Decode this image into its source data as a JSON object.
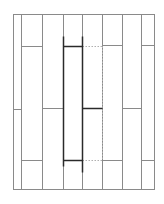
{
  "diagram": {
    "title": "",
    "colors": {
      "line": "#8a8a8a",
      "highlight": "#2a2a2a",
      "dotted": "#b0b0b0",
      "background": "#ffffff"
    },
    "outer": {
      "x1": 13,
      "y1": 14,
      "x2": 154,
      "y2": 189
    },
    "verticals": [
      21,
      42,
      63,
      82,
      102,
      122,
      141
    ],
    "joints": [
      {
        "x1": 13,
        "x2": 21,
        "y": 109
      },
      {
        "x1": 21,
        "x2": 42,
        "y": 46
      },
      {
        "x1": 21,
        "x2": 42,
        "y": 160
      },
      {
        "x1": 42,
        "x2": 63,
        "y": 108
      },
      {
        "x1": 102,
        "x2": 122,
        "y": 45
      },
      {
        "x1": 102,
        "x2": 122,
        "y": 160
      },
      {
        "x1": 122,
        "x2": 141,
        "y": 108
      },
      {
        "x1": 141,
        "x2": 154,
        "y": 45
      },
      {
        "x1": 141,
        "x2": 154,
        "y": 160
      }
    ],
    "highlight": {
      "bold_verticals": [
        {
          "x": 63,
          "y1": 36,
          "y2": 166
        },
        {
          "x": 82,
          "y1": 36,
          "y2": 172
        }
      ],
      "bold_joints": [
        {
          "x1": 63,
          "x2": 82,
          "y": 46
        },
        {
          "x1": 63,
          "x2": 82,
          "y": 160
        },
        {
          "x1": 82,
          "x2": 102,
          "y": 108
        }
      ],
      "dotted_joints": [
        {
          "x1": 82,
          "x2": 102,
          "y": 46
        },
        {
          "x1": 82,
          "x2": 102,
          "y": 160
        }
      ],
      "dotted_verticals": [
        {
          "x": 102,
          "y1": 46,
          "y2": 160
        }
      ]
    }
  }
}
